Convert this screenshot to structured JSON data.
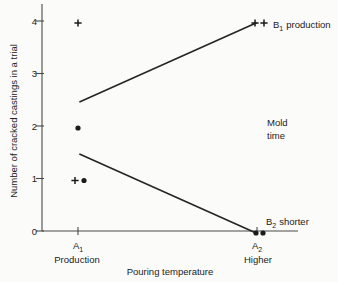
{
  "colors": {
    "background": "#fbfbf9",
    "ink": "#222222",
    "axis": "#4a4a4a",
    "line": "#262626",
    "marker": "#1b1b1b"
  },
  "chart_data": {
    "type": "line",
    "title": "",
    "xlabel": "Pouring temperature",
    "ylabel": "Number of cracked castings in a trial",
    "ylim": [
      0,
      4
    ],
    "yticks": [
      4,
      3,
      2,
      1,
      0
    ],
    "grid": false,
    "x_categories": [
      {
        "base": "A",
        "sub": "1",
        "sublabel": "Production"
      },
      {
        "base": "A",
        "sub": "2",
        "sublabel": "Higher"
      }
    ],
    "annotation": {
      "line1": "Mold",
      "line2": "time"
    },
    "series": [
      {
        "label_base": "B",
        "label_sub": "1",
        "label_rest": "production",
        "marker": "plus",
        "means": [
          2.5,
          4
        ],
        "points": [
          {
            "cat": 0,
            "value": 4,
            "dx": 0
          },
          {
            "cat": 0,
            "value": 1,
            "dx": -3
          },
          {
            "cat": 1,
            "value": 4,
            "dx": -2
          },
          {
            "cat": 1,
            "value": 4,
            "dx": 7
          }
        ]
      },
      {
        "label_base": "B",
        "label_sub": "2",
        "label_rest": "shorter",
        "marker": "dot",
        "means": [
          1.5,
          0
        ],
        "points": [
          {
            "cat": 0,
            "value": 2,
            "dx": 0
          },
          {
            "cat": 0,
            "value": 1,
            "dx": 6
          },
          {
            "cat": 1,
            "value": 0,
            "dx": -1
          },
          {
            "cat": 1,
            "value": 0,
            "dx": 6
          }
        ]
      }
    ]
  }
}
